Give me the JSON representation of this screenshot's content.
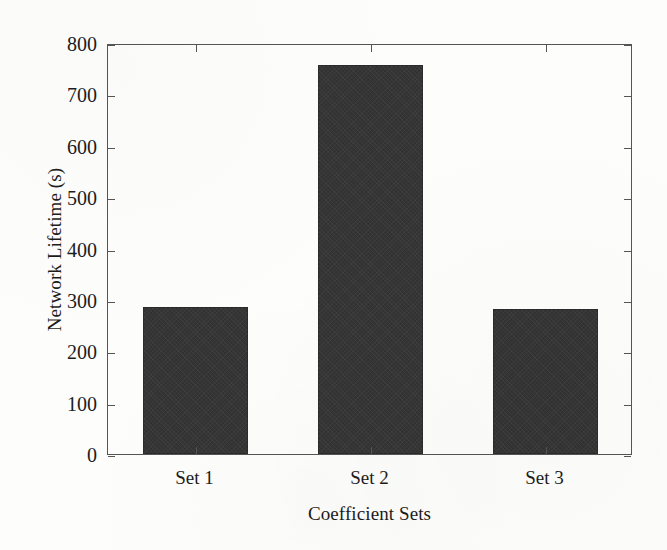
{
  "chart_data": {
    "type": "bar",
    "title": "",
    "subtitle": "",
    "categories": [
      "Set 1",
      "Set 2",
      "Set 3"
    ],
    "values": [
      287,
      757,
      282
    ],
    "xlabel": "Coefficient Sets",
    "ylabel": "Network Lifetime (s)",
    "ylim": [
      0,
      800
    ],
    "yticks": [
      0,
      100,
      200,
      300,
      400,
      500,
      600,
      700,
      800
    ],
    "ytick_labels": [
      "0",
      "100",
      "200",
      "300",
      "400",
      "500",
      "600",
      "700",
      "800"
    ],
    "grid": false,
    "legend": null,
    "legend_position": "none",
    "annotations": [],
    "series": [
      {
        "name": "Network Lifetime",
        "values": [
          287,
          757,
          282
        ]
      }
    ]
  },
  "style": {
    "bar_color": "#333232",
    "bar_edge_color": "#2b2b2b",
    "axis_color": "#555555",
    "text_color": "#1c1c1c",
    "background_color": "#fdfdfb"
  }
}
